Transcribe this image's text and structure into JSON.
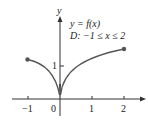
{
  "diagram": {
    "type": "function-graph",
    "annotation": {
      "line1": "y = f(x)",
      "line2": "D: −1 ≤ x ≤ 2"
    },
    "axes": {
      "x_label": "",
      "y_label": "y",
      "x_ticks": [
        {
          "value": -1,
          "label": "−1"
        },
        {
          "value": 0,
          "label": "0"
        },
        {
          "value": 1,
          "label": "1"
        },
        {
          "value": 2,
          "label": "2"
        }
      ],
      "y_ticks": [
        {
          "value": 1,
          "label": "1"
        }
      ]
    },
    "curve": {
      "description": "Concave branches meeting at a cusp at the origin",
      "domain": [
        -1,
        2
      ],
      "endpoints": [
        {
          "x": -1,
          "y": 1.2,
          "closed": true
        },
        {
          "x": 2,
          "y": 1.5,
          "closed": true
        }
      ],
      "cusp": {
        "x": 0,
        "y": 0
      }
    },
    "colors": {
      "curve": "#555555",
      "axes": "#333333",
      "endpoint": "#555555"
    }
  }
}
